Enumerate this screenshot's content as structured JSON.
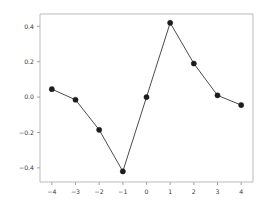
{
  "chart_data": {
    "type": "line",
    "title": "",
    "subtitle": "",
    "xlabel": "",
    "ylabel": "",
    "x": [
      -4,
      -3,
      -2,
      -1,
      0,
      1,
      2,
      3,
      4
    ],
    "values": [
      0.045,
      -0.015,
      -0.185,
      -0.42,
      0.0,
      0.42,
      0.19,
      0.01,
      -0.045
    ],
    "series": [
      {
        "name": "series-1",
        "x": [
          -4,
          -3,
          -2,
          -1,
          0,
          1,
          2,
          3,
          4
        ],
        "values": [
          0.045,
          -0.015,
          -0.185,
          -0.42,
          0.0,
          0.42,
          0.19,
          0.01,
          -0.045
        ]
      }
    ],
    "xlim": [
      -4.5,
      4.5
    ],
    "ylim": [
      -0.48,
      0.47
    ],
    "xticks": [
      -4,
      -3,
      -2,
      -1,
      0,
      1,
      2,
      3,
      4
    ],
    "xtick_labels": [
      "−4",
      "−3",
      "−2",
      "−1",
      "0",
      "1",
      "2",
      "3",
      "4"
    ],
    "yticks": [
      -0.4,
      -0.2,
      0.0,
      0.2,
      0.4
    ],
    "ytick_labels": [
      "−0.4",
      "−0.2",
      "0.0",
      "0.2",
      "0.4"
    ],
    "grid": false,
    "legend": null,
    "marker": "circle",
    "line_color": "#4c4c4c",
    "marker_color": "#1c1c1c",
    "axis_color": "#b9b9b9",
    "background_color": "#ffffff"
  }
}
